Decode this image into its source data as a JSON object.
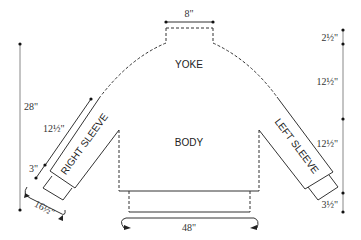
{
  "diagram": {
    "type": "sweater-schematic",
    "pieces": {
      "yoke": "YOKE",
      "body": "BODY",
      "right_sleeve": "RIGHT SLEEVE",
      "left_sleeve": "LEFT SLEEVE"
    },
    "measurements": {
      "neck_width": "8\"",
      "total_length": "28\"",
      "neck_depth": "2½\"",
      "yoke_depth": "12½\"",
      "body_length": "12½\"",
      "hem_ribbing": "3½\"",
      "sleeve_length": "12½\"",
      "cuff_length": "3\"",
      "cuff_circumference": "16½\"",
      "chest_circumference": "48\""
    },
    "colors": {
      "line": "#333333",
      "text": "#222222",
      "background": "#ffffff"
    }
  }
}
